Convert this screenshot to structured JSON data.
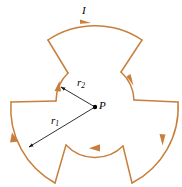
{
  "figure": {
    "kind": "physics-diagram",
    "width": 182,
    "height": 187,
    "background_color": "#ffffff",
    "wire_color": "#c87f3c",
    "line_color": "#1a1a1a",
    "labels": {
      "current": "I",
      "center_point": "P",
      "outer_radius": "r",
      "outer_radius_sub": "1",
      "inner_radius": "r",
      "inner_radius_sub": "2"
    },
    "geometry": {
      "center": [
        95,
        107
      ],
      "outer_radius_px": 85,
      "inner_radius_px": 40,
      "fold_symmetry": 3,
      "outer_arc_span_deg": 75,
      "inner_arc_span_deg": 45,
      "current_sense": "clockwise"
    },
    "vectors": [
      {
        "name": "r1",
        "from": [
          95,
          107
        ],
        "to": [
          27,
          148
        ],
        "label": "r1"
      },
      {
        "name": "r2",
        "from": [
          95,
          107
        ],
        "to": [
          59,
          86
        ],
        "label": "r2"
      }
    ],
    "arrowheads": [
      {
        "name": "current-arrow-top-outer",
        "at": [
          85,
          23
        ]
      },
      {
        "name": "current-arrow-right-outer",
        "at": [
          163,
          141
        ]
      },
      {
        "name": "current-arrow-left-outer",
        "at": [
          15,
          138
        ]
      },
      {
        "name": "current-arrow-upper-right-inner",
        "at": [
          131,
          81
        ]
      },
      {
        "name": "current-arrow-bottom-inner",
        "at": [
          95,
          148
        ]
      },
      {
        "name": "current-arrow-upper-left-inner",
        "at": [
          58,
          84
        ]
      }
    ]
  }
}
